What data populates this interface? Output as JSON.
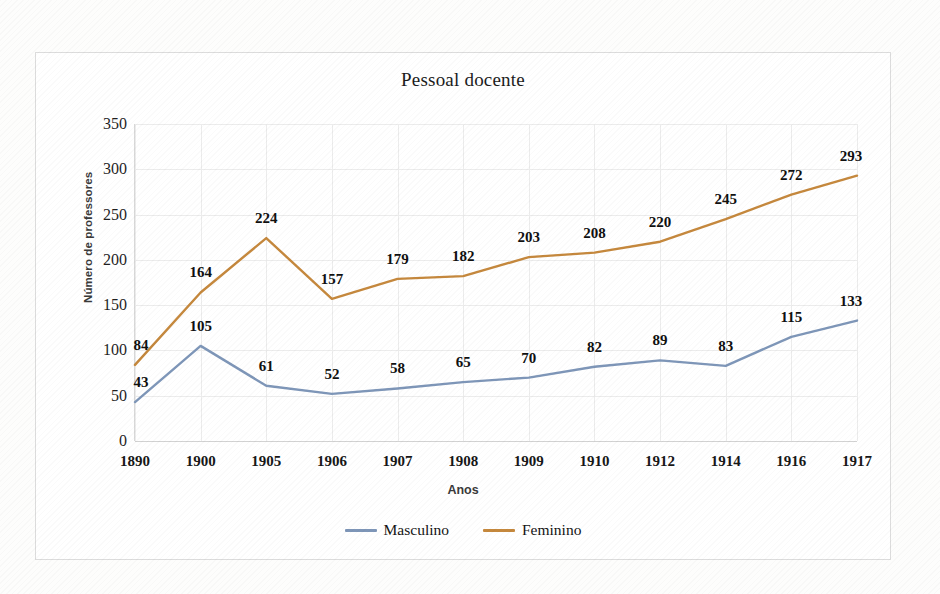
{
  "chart_data": {
    "type": "line",
    "title": "Pessoal docente",
    "xlabel": "Anos",
    "ylabel": "Número de professores",
    "categories": [
      "1890",
      "1900",
      "1905",
      "1906",
      "1907",
      "1908",
      "1909",
      "1910",
      "1912",
      "1914",
      "1916",
      "1917"
    ],
    "series": [
      {
        "name": "Masculino",
        "color": "#7e96b8",
        "values": [
          43,
          105,
          61,
          52,
          58,
          65,
          70,
          82,
          89,
          83,
          115,
          133
        ]
      },
      {
        "name": "Feminino",
        "color": "#c5883d",
        "values": [
          84,
          164,
          224,
          157,
          179,
          182,
          203,
          208,
          220,
          245,
          272,
          293
        ]
      }
    ],
    "ylim": [
      0,
      350
    ],
    "ytick_values": [
      0,
      50,
      100,
      150,
      200,
      250,
      300,
      350
    ],
    "ytick_labels": [
      "0",
      "50",
      "100",
      "150",
      "200",
      "250",
      "300",
      "350"
    ],
    "grid": true,
    "legend_position": "bottom",
    "data_labels": true
  },
  "legend": {
    "entries": [
      {
        "label": "Masculino",
        "color": "#7e96b8"
      },
      {
        "label": "Feminino",
        "color": "#c5883d"
      }
    ]
  }
}
